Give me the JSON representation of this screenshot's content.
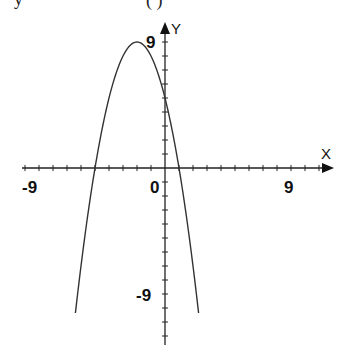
{
  "header_fragment": {
    "left": "y",
    "middle": "( )"
  },
  "chart_data": {
    "type": "line",
    "title": "",
    "function": "f(x) = -x^2 - 4x + 5",
    "xlabel": "X",
    "ylabel": "Y",
    "xlim": [
      -11,
      12
    ],
    "ylim": [
      -12.5,
      10
    ],
    "x_tick_labels": [
      {
        "value": -9,
        "label": "-9"
      },
      {
        "value": 0,
        "label": "0"
      },
      {
        "value": 9,
        "label": "9"
      }
    ],
    "y_tick_labels": [
      {
        "value": 9,
        "label": "9"
      },
      {
        "value": -9,
        "label": "-9"
      }
    ],
    "tick_step": 1,
    "grid": false,
    "key_points": {
      "vertex": [
        -2,
        9
      ],
      "roots": [
        -5,
        1
      ],
      "y_intercept": [
        0,
        5
      ]
    },
    "series": [
      {
        "name": "parabola",
        "x": [
          -6.4,
          -6,
          -5.5,
          -5,
          -4.5,
          -4,
          -3.5,
          -3,
          -2.5,
          -2,
          -1.5,
          -1,
          -0.5,
          0,
          0.5,
          1,
          1.5,
          2,
          2.4
        ],
        "values": [
          -10.36,
          -7,
          -2.75,
          0,
          2.75,
          5,
          6.75,
          8,
          8.75,
          9,
          8.75,
          8,
          6.75,
          5,
          2.75,
          0,
          -2.75,
          -7,
          -10.36
        ]
      }
    ],
    "color": "#333333"
  }
}
